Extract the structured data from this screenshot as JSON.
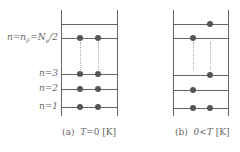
{
  "levels": {
    "fermi": {
      "label_n": "n=n",
      "sub1": "F",
      "label_mid": "=N",
      "sub2": "e",
      "label_end": "/2"
    },
    "n3": "n=3",
    "n2": "n=2",
    "n1": "n=1"
  },
  "panels": [
    {
      "id": "a",
      "caption_prefix": "(a)",
      "caption_T": "T",
      "caption_rest": "=0 [K]",
      "occupancy": {
        "top": [],
        "fermi": [
          1,
          2
        ],
        "n3": [
          1,
          2
        ],
        "n2": [
          1,
          2
        ],
        "n1": [
          1,
          2
        ]
      }
    },
    {
      "id": "b",
      "caption_prefix": "(b)",
      "caption_T": "0<T",
      "caption_rest": " [K]",
      "occupancy": {
        "top": [
          2
        ],
        "fermi": [
          1
        ],
        "n3": [
          2
        ],
        "n2": [
          1
        ],
        "n1": [
          1,
          2
        ]
      }
    }
  ],
  "colors": {
    "line": "#666666",
    "dot": "#555555",
    "dotted": "#aaaaaa"
  }
}
